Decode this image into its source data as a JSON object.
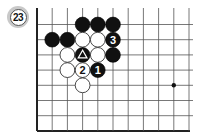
{
  "problem": {
    "number_label": "23"
  },
  "board": {
    "visible_columns": 11,
    "visible_rows": 8,
    "edges": {
      "left": true,
      "bottom": true,
      "top": false,
      "right": false
    },
    "colors": {
      "line": "#555555",
      "black": "#111111",
      "white": "#ffffff",
      "badge_ring": "#c9c9c9"
    },
    "star_points": [
      {
        "col": 9,
        "row": 4
      }
    ],
    "stones": [
      {
        "col": 3,
        "row": 0,
        "color": "black"
      },
      {
        "col": 4,
        "row": 0,
        "color": "black"
      },
      {
        "col": 5,
        "row": 0,
        "color": "black"
      },
      {
        "col": 1,
        "row": 1,
        "color": "black"
      },
      {
        "col": 2,
        "row": 1,
        "color": "black"
      },
      {
        "col": 3,
        "row": 1,
        "color": "white"
      },
      {
        "col": 4,
        "row": 1,
        "color": "white"
      },
      {
        "col": 5,
        "row": 1,
        "color": "black",
        "label": "3"
      },
      {
        "col": 2,
        "row": 2,
        "color": "white"
      },
      {
        "col": 3,
        "row": 2,
        "color": "black",
        "mark": "triangle"
      },
      {
        "col": 4,
        "row": 2,
        "color": "white"
      },
      {
        "col": 5,
        "row": 2,
        "color": "black"
      },
      {
        "col": 2,
        "row": 3,
        "color": "white"
      },
      {
        "col": 3,
        "row": 3,
        "color": "white",
        "label": "2"
      },
      {
        "col": 4,
        "row": 3,
        "color": "black",
        "label": "1"
      },
      {
        "col": 3,
        "row": 4,
        "color": "white"
      }
    ]
  }
}
